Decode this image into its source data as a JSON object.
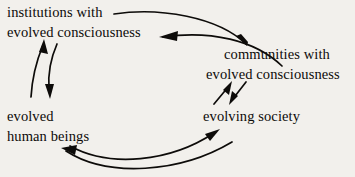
{
  "diagram": {
    "background_color": "#f2f0ec",
    "ink_color": "#0d0b09",
    "nodes": {
      "institutions": {
        "line1": "institutions with",
        "line2": "evolved consciousness"
      },
      "communities": {
        "line1": "communities with",
        "line2": "evolved consciousness"
      },
      "human_beings": {
        "line1": "evolved",
        "line2": "human beings"
      },
      "evolving_society": {
        "line1": "evolving society"
      }
    },
    "arrows": [
      {
        "name": "institutions-to-communities",
        "from": "institutions with evolved consciousness",
        "to": "communities with evolved consciousness",
        "direction": "right-down"
      },
      {
        "name": "communities-to-institutions",
        "from": "communities with evolved consciousness",
        "to": "evolved consciousness (institutions)",
        "direction": "left"
      },
      {
        "name": "human-beings-to-institutions",
        "from": "evolved human beings",
        "to": "institutions with evolved consciousness",
        "direction": "up"
      },
      {
        "name": "institutions-to-human-beings",
        "from": "institutions with evolved consciousness",
        "to": "evolved human beings",
        "direction": "down"
      },
      {
        "name": "evolving-society-to-communities",
        "from": "evolving society",
        "to": "communities with evolved consciousness",
        "direction": "up-right"
      },
      {
        "name": "communities-to-evolving-society",
        "from": "communities with evolved consciousness",
        "to": "evolving society",
        "direction": "down-left"
      },
      {
        "name": "human-beings-to-evolving-society",
        "from": "evolved human beings",
        "to": "evolving society",
        "direction": "right-up"
      },
      {
        "name": "evolving-society-to-human-beings",
        "from": "evolving society",
        "to": "evolved human beings",
        "direction": "left"
      }
    ]
  }
}
